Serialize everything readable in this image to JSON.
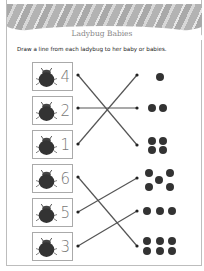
{
  "worksheet": {
    "title": "Ladybug Babies",
    "instruction": "Draw a line from each ladybug to her baby or babies.",
    "left_items": [
      {
        "number": "4",
        "icon": "ladybug-icon"
      },
      {
        "number": "2",
        "icon": "ladybug-icon"
      },
      {
        "number": "1",
        "icon": "ladybug-icon"
      },
      {
        "number": "6",
        "icon": "ladybug-icon"
      },
      {
        "number": "5",
        "icon": "ladybug-icon"
      },
      {
        "number": "3",
        "icon": "ladybug-icon"
      }
    ],
    "right_groups": [
      {
        "count": 1,
        "icon": "baby-ladybug-icon"
      },
      {
        "count": 2,
        "icon": "baby-ladybug-icon"
      },
      {
        "count": 4,
        "icon": "baby-ladybug-icon"
      },
      {
        "count": 5,
        "icon": "baby-ladybug-icon"
      },
      {
        "count": 3,
        "icon": "baby-ladybug-icon"
      },
      {
        "count": 6,
        "icon": "baby-ladybug-icon"
      }
    ],
    "connections": [
      {
        "from": "4",
        "to_group_count": 4
      },
      {
        "from": "2",
        "to_group_count": 2
      },
      {
        "from": "1",
        "to_group_count": 1
      },
      {
        "from": "6",
        "to_group_count": 6
      },
      {
        "from": "5",
        "to_group_count": 5
      },
      {
        "from": "3",
        "to_group_count": 3
      }
    ],
    "colors": {
      "line": "#555555",
      "bug": "#333333",
      "number": "#777777",
      "border": "#aaaaaa"
    }
  }
}
